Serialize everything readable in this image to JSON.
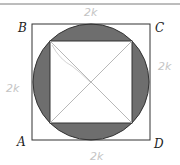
{
  "diagram": {
    "type": "geometry",
    "vertices": {
      "A": "A",
      "B": "B",
      "C": "C",
      "D": "D"
    },
    "annotations": {
      "top": "2k",
      "left": "2k",
      "right": "2k",
      "bottom": "2k"
    },
    "colors": {
      "stroke": "#333333",
      "shade": "#6e6e6e",
      "diagonal": "#b8b8b8",
      "handwriting": "#c4c4c4"
    }
  }
}
